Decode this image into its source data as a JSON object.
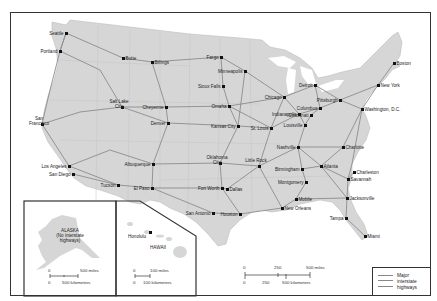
{
  "map": {
    "title": "",
    "land_color": "#d6d6d6",
    "highway_color": "#8c8c8c",
    "border_color": "#333333"
  },
  "cities": [
    {
      "name": "Seattle",
      "x": 66,
      "y": 33
    },
    {
      "name": "Portland",
      "x": 60,
      "y": 51
    },
    {
      "name": "Butte",
      "x": 123,
      "y": 58
    },
    {
      "name": "Billings",
      "x": 152,
      "y": 62
    },
    {
      "name": "Fargo",
      "x": 221,
      "y": 57
    },
    {
      "name": "Minneapolis",
      "x": 245,
      "y": 71
    },
    {
      "name": "Sioux Falls",
      "x": 223,
      "y": 86
    },
    {
      "name": "Boston",
      "x": 394,
      "y": 63
    },
    {
      "name": "Detroit",
      "x": 315,
      "y": 85
    },
    {
      "name": "New York",
      "x": 378,
      "y": 85
    },
    {
      "name": "Chicago",
      "x": 284,
      "y": 97
    },
    {
      "name": "Pittsburgh",
      "x": 340,
      "y": 100
    },
    {
      "name": "Cheyenne",
      "x": 166,
      "y": 107
    },
    {
      "name": "Omaha",
      "x": 229,
      "y": 106
    },
    {
      "name": "Salt Lake City",
      "x": 122,
      "y": 107
    },
    {
      "name": "Columbus",
      "x": 320,
      "y": 108
    },
    {
      "name": "Washington, D.C.",
      "x": 362,
      "y": 109
    },
    {
      "name": "Indianapolis",
      "x": 299,
      "y": 114
    },
    {
      "name": "Cincinnati",
      "x": 311,
      "y": 115
    },
    {
      "name": "San Francisco",
      "x": 42,
      "y": 124
    },
    {
      "name": "Denver",
      "x": 168,
      "y": 123
    },
    {
      "name": "Kansas City",
      "x": 238,
      "y": 126
    },
    {
      "name": "St. Louis",
      "x": 271,
      "y": 128
    },
    {
      "name": "Louisville",
      "x": 305,
      "y": 125
    },
    {
      "name": "Nashville",
      "x": 298,
      "y": 147
    },
    {
      "name": "Charlotte",
      "x": 343,
      "y": 147
    },
    {
      "name": "Oklahoma City",
      "x": 220,
      "y": 163
    },
    {
      "name": "Little Rock",
      "x": 259,
      "y": 166
    },
    {
      "name": "Albuquerque",
      "x": 153,
      "y": 164
    },
    {
      "name": "Los Angeles",
      "x": 69,
      "y": 166
    },
    {
      "name": "San Diego",
      "x": 73,
      "y": 174
    },
    {
      "name": "Birmingham",
      "x": 302,
      "y": 169
    },
    {
      "name": "Atlanta",
      "x": 321,
      "y": 166
    },
    {
      "name": "Charleston",
      "x": 354,
      "y": 172
    },
    {
      "name": "Montgomery",
      "x": 306,
      "y": 182
    },
    {
      "name": "Savannah",
      "x": 348,
      "y": 179
    },
    {
      "name": "Tucson",
      "x": 118,
      "y": 185
    },
    {
      "name": "El Paso",
      "x": 152,
      "y": 188
    },
    {
      "name": "Fort Worth",
      "x": 222,
      "y": 188
    },
    {
      "name": "Dallas",
      "x": 227,
      "y": 189
    },
    {
      "name": "Jacksonville",
      "x": 347,
      "y": 198
    },
    {
      "name": "Mobile",
      "x": 296,
      "y": 199
    },
    {
      "name": "San Antonio",
      "x": 213,
      "y": 213
    },
    {
      "name": "Houston",
      "x": 240,
      "y": 214
    },
    {
      "name": "New Orleans",
      "x": 282,
      "y": 208
    },
    {
      "name": "Tampa",
      "x": 346,
      "y": 218
    },
    {
      "name": "Miami",
      "x": 365,
      "y": 236
    }
  ],
  "insets": {
    "alaska": {
      "title": "ALASKA",
      "subtitle": "(No interstate highways)",
      "scale_miles_0": "0",
      "scale_miles_end": "500 miles",
      "scale_km_0": "0",
      "scale_km_end": "500 kilometers"
    },
    "hawaii": {
      "title": "HAWAII",
      "city": "Honolulu",
      "scale_miles_0": "0",
      "scale_miles_end": "100 miles",
      "scale_km_0": "0",
      "scale_km_end": "100 kilometers"
    }
  },
  "main_scale": {
    "miles": [
      "0",
      "250",
      "500 miles"
    ],
    "km": [
      "0",
      "250",
      "500 kilometers"
    ]
  },
  "legend": {
    "label": "Major interstate highways"
  }
}
